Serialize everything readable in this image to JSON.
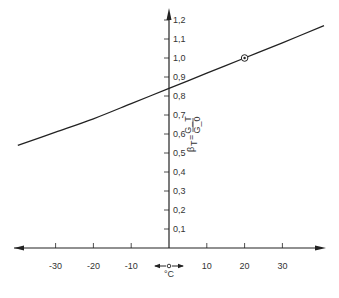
{
  "chart_data": {
    "type": "line",
    "title": "",
    "xlabel": "°C",
    "ylabel": "β_T = G_T / G_0",
    "ylabel_parts": {
      "beta": "β",
      "sub": "T",
      "eq": "=",
      "num": "G_T",
      "den": "G_0"
    },
    "x_ticks": [
      -30,
      -20,
      -10,
      10,
      20,
      30
    ],
    "x_tick_labels": [
      "-30",
      "-20",
      "-10",
      "10",
      "20",
      "30"
    ],
    "y_ticks": [
      0.1,
      0.2,
      0.3,
      0.4,
      0.5,
      0.6,
      0.7,
      0.8,
      0.9,
      1.0,
      1.1,
      1.2
    ],
    "y_tick_labels": [
      "0,1",
      "0,2",
      "0,3",
      "0,4",
      "0,5",
      "0,6",
      "0,7",
      "0,8",
      "0,9",
      "1,0",
      "1,1",
      "1,2"
    ],
    "xlim": [
      -44,
      44
    ],
    "ylim": [
      0,
      1.28
    ],
    "grid": false,
    "legend": null,
    "series": [
      {
        "name": "β_T",
        "x": [
          -40,
          -30,
          -20,
          -10,
          0,
          10,
          20,
          30,
          41
        ],
        "y": [
          0.54,
          0.61,
          0.68,
          0.76,
          0.84,
          0.92,
          1.0,
          1.08,
          1.17
        ]
      }
    ],
    "annotations": [
      {
        "type": "circled-point",
        "x": 20,
        "y": 1.0,
        "label": "reference point"
      },
      {
        "type": "double-arrow",
        "text": "°C",
        "position": "below origin"
      }
    ]
  }
}
